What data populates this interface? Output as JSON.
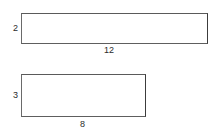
{
  "diagram": {
    "type": "geometry-rectangles",
    "background_color": "#ffffff",
    "stroke_color": "#6e6e6e",
    "label_color": "#2b2b2b",
    "shapes": [
      {
        "name": "rectangle-1",
        "width_label": "12",
        "height_label": "2",
        "width_value": 12,
        "height_value": 2
      },
      {
        "name": "rectangle-2",
        "width_label": "8",
        "height_label": "3",
        "width_value": 8,
        "height_value": 3
      }
    ]
  }
}
